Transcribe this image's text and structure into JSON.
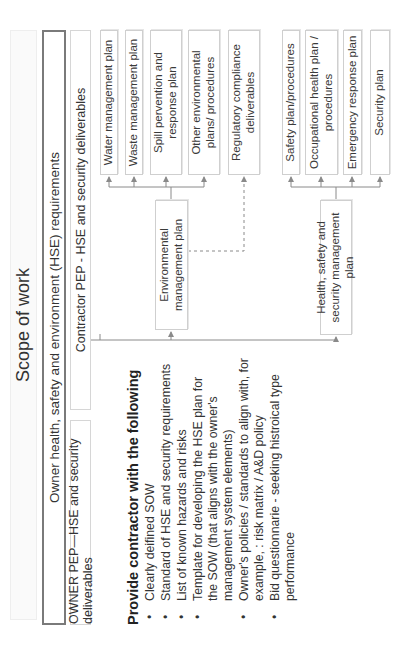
{
  "title": "Scope of work",
  "header": {
    "requirements_label": "Owner health, safety and environment (HSE) requirements",
    "owner_deliverables": "OWNER PEP—HSE and security deliverables",
    "contractor_deliverables": "Contractor PEP - HSE and security deliverables"
  },
  "plans": {
    "environmental": "Environmental management plan",
    "hss": "Health, safety and security management plan"
  },
  "environmental_items": [
    {
      "label": "Water management plan"
    },
    {
      "label": "Waste management plan"
    },
    {
      "label": "Spill pervention and response plan"
    },
    {
      "label": "Other environmental plans/ procedures"
    }
  ],
  "regulatory": "Regulatory compliance deliverables",
  "hss_items": [
    {
      "label": "Safety plan/procedures"
    },
    {
      "label": "Occupational health plan / procedures"
    },
    {
      "label": "Emergency response plan"
    },
    {
      "label": "Security plan"
    }
  ],
  "contractor_list": {
    "heading": "Provide contractor with the following",
    "items": [
      "Clearly deifined SOW",
      "Standard of HSE and security requirements",
      "List of known hazards and risks",
      "Template for developing the HSE plan for the SOW (that aligns with the owner's management system elements)",
      "Owner's policies / standards to align with, for example, : risk matrix / A&D policy",
      "Bid questionnarie - seeking histroical type performance"
    ]
  },
  "colors": {
    "line": "#8a8a8a",
    "box_border": "#cfcfcf",
    "title_border": "#7a7a7a"
  }
}
